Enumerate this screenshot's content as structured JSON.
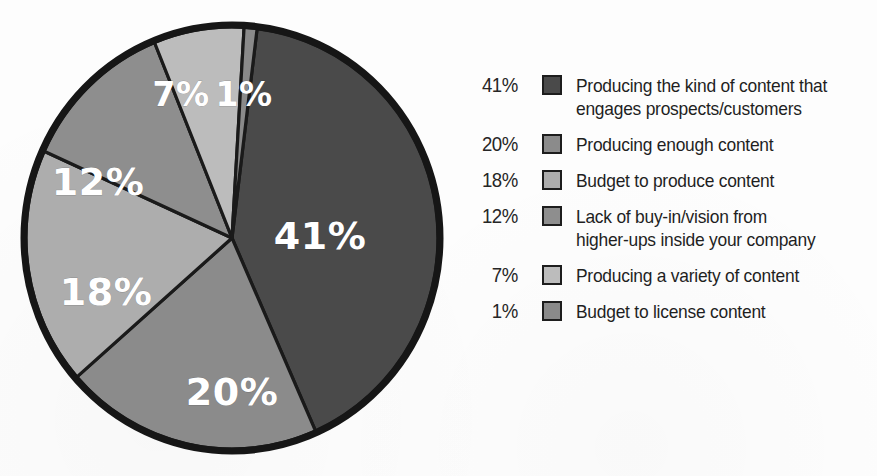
{
  "chart_data": {
    "type": "pie",
    "title": "",
    "subtitle": "",
    "xlabel": "",
    "ylabel": "",
    "grid": false,
    "legend_position": "right",
    "units": "percent",
    "start_angle_deg": -83,
    "direction": "clockwise",
    "categories": [
      "Producing the kind of content that engages prospects/customers",
      "Producing enough content",
      "Budget to produce content",
      "Lack of buy-in/vision from higher-ups inside your company",
      "Producing a variety of content",
      "Budget to license content"
    ],
    "values": [
      41,
      20,
      18,
      12,
      7,
      1
    ],
    "slice_labels": [
      "41%",
      "20%",
      "18%",
      "12%",
      "7%",
      "1%"
    ],
    "colors": [
      "#4a4a4a",
      "#8b8b8b",
      "#adadad",
      "#8e8e8e",
      "#bcbcbc",
      "#8a8a8a"
    ],
    "slice_label_color": "#ffffff",
    "outline_color": "#1a1a1a"
  },
  "pie": {
    "slices": [
      {
        "label": "41%",
        "value": 41,
        "color": "#4a4a4a",
        "label_x": 302,
        "label_y": 222,
        "size": "normal"
      },
      {
        "label": "20%",
        "value": 20,
        "color": "#8b8b8b",
        "label_x": 214,
        "label_y": 378,
        "size": "normal"
      },
      {
        "label": "18%",
        "value": 18,
        "color": "#adadad",
        "label_x": 88,
        "label_y": 278,
        "size": "normal"
      },
      {
        "label": "12%",
        "value": 12,
        "color": "#8e8e8e",
        "label_x": 80,
        "label_y": 168,
        "size": "normal"
      },
      {
        "label": "7%",
        "value": 7,
        "color": "#bcbcbc",
        "label_x": 163,
        "label_y": 80,
        "size": "small"
      },
      {
        "label": "1%",
        "value": 1,
        "color": "#8a8a8a",
        "label_x": 226,
        "label_y": 80,
        "size": "small"
      }
    ]
  },
  "legend": {
    "items": [
      {
        "percent": "41%",
        "color": "#4a4a4a",
        "line1": "Producing the kind of content that",
        "line2": "engages prospects/customers"
      },
      {
        "percent": "20%",
        "color": "#8b8b8b",
        "line1": "Producing enough content",
        "line2": ""
      },
      {
        "percent": "18%",
        "color": "#adadad",
        "line1": "Budget to produce content",
        "line2": ""
      },
      {
        "percent": "12%",
        "color": "#8e8e8e",
        "line1": "Lack of buy-in/vision from",
        "line2": "higher-ups inside your company"
      },
      {
        "percent": "7%",
        "color": "#bcbcbc",
        "line1": "Producing a variety of content",
        "line2": ""
      },
      {
        "percent": "1%",
        "color": "#8a8a8a",
        "line1": "Budget to license content",
        "line2": ""
      }
    ]
  }
}
